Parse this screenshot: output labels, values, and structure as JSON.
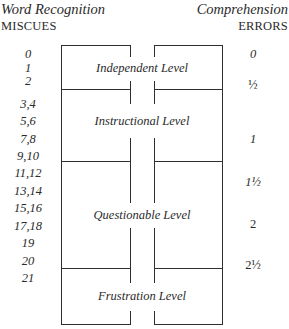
{
  "header": {
    "left_title": "Word Recognition",
    "left_subtitle": "MISCUES",
    "right_title": "Comprehension",
    "right_subtitle": "ERRORS"
  },
  "miscues": [
    "0",
    "1",
    "2",
    "3,4",
    "5,6",
    "7,8",
    "9,10",
    "11,12",
    "13,14",
    "15,16",
    "17,18",
    "19",
    "20",
    "21"
  ],
  "errors": [
    "0",
    "½",
    "1",
    "1½",
    "2",
    "2½"
  ],
  "levels": [
    {
      "label": "Independent Level"
    },
    {
      "label": "Instructional Level"
    },
    {
      "label": "Questionable Level"
    },
    {
      "label": "Frustration Level"
    }
  ],
  "colors": {
    "line": "#2f2f2f",
    "text": "#2a2a2a",
    "background": "#ffffff"
  }
}
